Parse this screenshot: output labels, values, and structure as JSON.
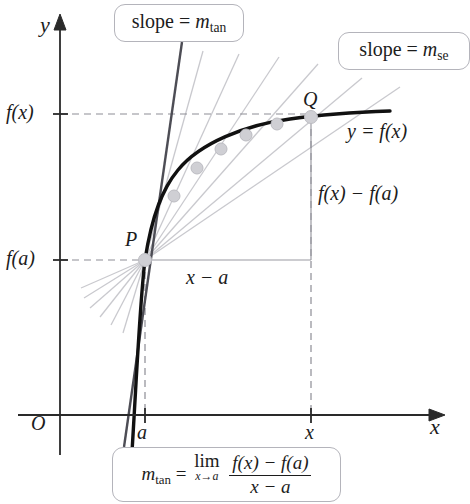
{
  "figure": {
    "axes": {
      "y_axis_label": "y",
      "x_axis_label": "x",
      "origin_label": "O",
      "y_ticks": [
        {
          "label_main": "f",
          "label_arg": "(x)",
          "full": "f(x)",
          "y_px": 114
        },
        {
          "label_main": "f",
          "label_arg": "(a)",
          "full": "f(a)",
          "y_px": 260
        }
      ],
      "x_ticks": [
        {
          "label": "a",
          "x_px": 145
        },
        {
          "label": "x",
          "x_px": 311
        }
      ]
    },
    "callouts": {
      "tangent": {
        "text_prefix": "slope = ",
        "symbol": "m",
        "subscript": "tan",
        "full": "slope = m_tan"
      },
      "secant": {
        "text_prefix": "slope = ",
        "symbol": "m",
        "subscript": "se",
        "full": "slope = m_se"
      }
    },
    "formula": {
      "lhs_symbol": "m",
      "lhs_subscript": "tan",
      "equals": "=",
      "limit_word": "lim",
      "limit_under": "x→a",
      "numerator": "f(x) − f(a)",
      "denominator": "x − a",
      "full": "m_tan = lim(x→a) [f(x) − f(a)] / (x − a)"
    },
    "points": {
      "P": {
        "label": "P",
        "x_px": 145,
        "y_px": 260
      },
      "Q": {
        "label": "Q",
        "x_px": 311,
        "y_px": 117
      },
      "intermediate": [
        {
          "x_px": 174,
          "y_px": 196
        },
        {
          "x_px": 197,
          "y_px": 168
        },
        {
          "x_px": 221,
          "y_px": 149
        },
        {
          "x_px": 246,
          "y_px": 135
        },
        {
          "x_px": 277,
          "y_px": 124
        }
      ]
    },
    "annotations": {
      "curve_label": "y = f(x)",
      "rise_label": "f(x) − f(a)",
      "run_label": "x − a"
    },
    "colors": {
      "curve": "#111111",
      "tangent_line": "#4d4d55",
      "secant_line": "#c9c9ce",
      "axis": "#2a2a2a",
      "dashed_guide": "#8d8d95",
      "dot_fill": "#cfcfd4",
      "callout_border": "#b4b4bb",
      "text": "#1c1c1c"
    }
  }
}
